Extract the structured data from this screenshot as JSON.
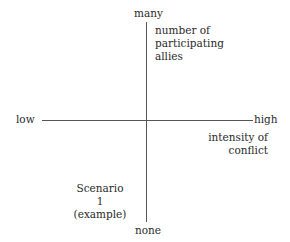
{
  "diagram": {
    "y_axis": {
      "top_label": "many",
      "bottom_label": "none",
      "title_lines": [
        "number of",
        "participating",
        "allies"
      ]
    },
    "x_axis": {
      "left_label": "low",
      "right_label": "high",
      "title_lines": [
        "intensity of",
        "conflict"
      ]
    },
    "scenario_lines": [
      "Scenario",
      "1",
      "(example)"
    ]
  }
}
